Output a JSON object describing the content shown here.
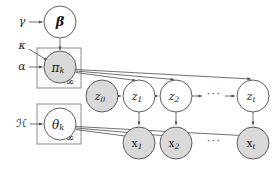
{
  "diagram": {
    "type": "probabilistic-graphical-model",
    "colors": {
      "observed_fill": "#d9d9d9",
      "latent_fill": "#ffffff",
      "node_stroke": "#4d4d4d",
      "plate_stroke": "#808080",
      "plate_fill": "#fbfbfb",
      "edge": "#4d4d4d",
      "text": "#1a1a1a",
      "ellipsis": "#555555",
      "background": "#ffffff"
    }
  },
  "hyperparameters": [
    {
      "id": "gamma",
      "label": "γ",
      "x": 22,
      "y": 22
    },
    {
      "id": "kappa",
      "label": "κ",
      "x": 22,
      "y": 47
    },
    {
      "id": "alpha",
      "label": "α",
      "x": 22,
      "y": 67
    },
    {
      "id": "base-measure",
      "label": "ℋ",
      "x": 21,
      "y": 124
    }
  ],
  "nodes": [
    {
      "id": "beta",
      "label": "β",
      "kind": "latent",
      "shaded": false,
      "style": "bold-greek",
      "x": 60,
      "y": 22,
      "r": 16,
      "font_size": 13
    },
    {
      "id": "pi-k",
      "label": "π",
      "subscript": "k",
      "kind": "observed",
      "shaded": true,
      "style": "greek",
      "x": 60,
      "y": 67,
      "r": 16,
      "font_size": 12
    },
    {
      "id": "theta-k",
      "label": "θ",
      "subscript": "k",
      "kind": "latent",
      "shaded": false,
      "style": "greek",
      "x": 60,
      "y": 124,
      "r": 16,
      "font_size": 12
    },
    {
      "id": "z0",
      "label": "z",
      "subscript": "0",
      "kind": "observed",
      "shaded": true,
      "style": "italic",
      "x": 102,
      "y": 96,
      "r": 16,
      "font_size": 11
    },
    {
      "id": "z1",
      "label": "z",
      "subscript": "1",
      "kind": "latent",
      "shaded": false,
      "style": "italic",
      "x": 139,
      "y": 96,
      "r": 16,
      "font_size": 11
    },
    {
      "id": "z2",
      "label": "z",
      "subscript": "2",
      "kind": "latent",
      "shaded": false,
      "style": "italic",
      "x": 176,
      "y": 96,
      "r": 16,
      "font_size": 11
    },
    {
      "id": "zt",
      "label": "z",
      "subscript": "t",
      "kind": "latent",
      "shaded": false,
      "style": "italic",
      "x": 253,
      "y": 96,
      "r": 16,
      "font_size": 11
    },
    {
      "id": "x1",
      "label": "x",
      "subscript": "1",
      "kind": "observed",
      "shaded": true,
      "style": "upright",
      "x": 139,
      "y": 143,
      "r": 16,
      "font_size": 11
    },
    {
      "id": "x2",
      "label": "x",
      "subscript": "2",
      "kind": "observed",
      "shaded": true,
      "style": "upright",
      "x": 176,
      "y": 143,
      "r": 16,
      "font_size": 11
    },
    {
      "id": "xt",
      "label": "x",
      "subscript": "t",
      "kind": "observed",
      "shaded": true,
      "style": "upright",
      "x": 253,
      "y": 143,
      "r": 16,
      "font_size": 11
    }
  ],
  "plates": [
    {
      "id": "plate-pi",
      "contains": "pi-k",
      "count_label": "∞",
      "x": 37,
      "y": 48,
      "width": 44,
      "height": 40,
      "count_x": 70,
      "count_y": 81
    },
    {
      "id": "plate-theta",
      "contains": "theta-k",
      "count_label": "∞",
      "x": 37,
      "y": 104,
      "width": 44,
      "height": 40,
      "count_x": 70,
      "count_y": 137
    }
  ],
  "ellipses": [
    {
      "id": "z-ellipsis",
      "label": "···",
      "x": 214,
      "y": 95
    },
    {
      "id": "x-ellipsis",
      "label": "···",
      "x": 214,
      "y": 142
    }
  ],
  "edges": [
    {
      "id": "gamma-to-beta",
      "from": "gamma",
      "to": "beta"
    },
    {
      "id": "beta-to-pi",
      "from": "beta",
      "to": "pi-k"
    },
    {
      "id": "kappa-to-pi",
      "from": "kappa",
      "to": "pi-k"
    },
    {
      "id": "alpha-to-pi",
      "from": "alpha",
      "to": "pi-k"
    },
    {
      "id": "base-measure-to-theta",
      "from": "base-measure",
      "to": "theta-k"
    },
    {
      "id": "pi-to-z1",
      "from": "pi-k",
      "to": "z1"
    },
    {
      "id": "pi-to-z2",
      "from": "pi-k",
      "to": "z2"
    },
    {
      "id": "pi-to-zt",
      "from": "pi-k",
      "to": "zt"
    },
    {
      "id": "z0-to-z1",
      "from": "z0",
      "to": "z1"
    },
    {
      "id": "z1-to-z2",
      "from": "z1",
      "to": "z2"
    },
    {
      "id": "z2-to-dots",
      "from": "z2",
      "to": "z-ellipsis"
    },
    {
      "id": "dots-to-zt",
      "from": "z-ellipsis",
      "to": "zt"
    },
    {
      "id": "z1-to-x1",
      "from": "z1",
      "to": "x1"
    },
    {
      "id": "z2-to-x2",
      "from": "z2",
      "to": "x2"
    },
    {
      "id": "zt-to-xt",
      "from": "zt",
      "to": "xt"
    },
    {
      "id": "theta-to-x1",
      "from": "theta-k",
      "to": "x1"
    },
    {
      "id": "theta-to-x2",
      "from": "theta-k",
      "to": "x2"
    },
    {
      "id": "theta-to-xt",
      "from": "theta-k",
      "to": "xt"
    }
  ]
}
